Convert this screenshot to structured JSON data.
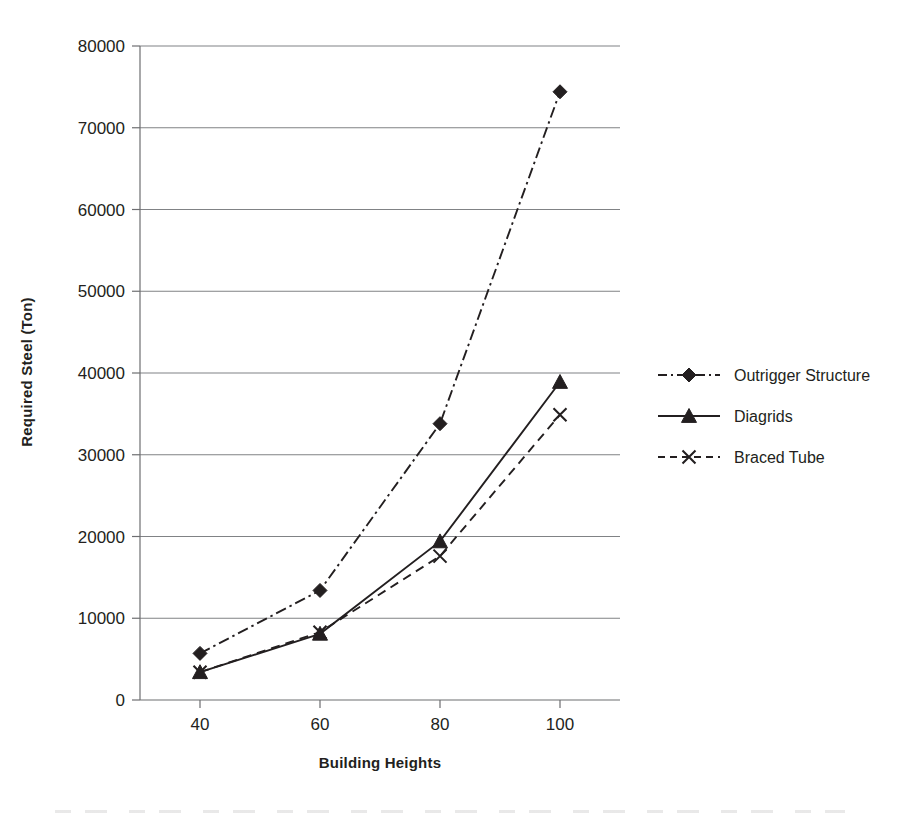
{
  "chart_data": {
    "type": "line",
    "title": "",
    "xlabel": "Building Heights",
    "ylabel": "Required Steel (Ton)",
    "x": [
      40,
      60,
      80,
      100
    ],
    "categories": [
      "40",
      "60",
      "80",
      "100"
    ],
    "xlim": [
      30,
      110
    ],
    "ylim": [
      0,
      80000
    ],
    "y_ticks": [
      0,
      10000,
      20000,
      30000,
      40000,
      50000,
      60000,
      70000,
      80000
    ],
    "y_tick_labels": [
      "0",
      "10000",
      "20000",
      "30000",
      "40000",
      "50000",
      "60000",
      "70000",
      "80000"
    ],
    "x_ticks": [
      40,
      60,
      80,
      100
    ],
    "x_tick_labels": [
      "40",
      "60",
      "80",
      "100"
    ],
    "grid": "horizontal",
    "legend_position": "right",
    "series": [
      {
        "name": "Outrigger Structure",
        "values": [
          5700,
          13400,
          33800,
          74400
        ],
        "line_style": "dashdot",
        "marker": "diamond",
        "color": "#231f20"
      },
      {
        "name": "Diagrids",
        "values": [
          3400,
          8100,
          19400,
          38900
        ],
        "line_style": "solid",
        "marker": "triangle",
        "color": "#231f20"
      },
      {
        "name": "Braced Tube",
        "values": [
          3400,
          8300,
          17600,
          34900
        ],
        "line_style": "dashed",
        "marker": "x",
        "color": "#231f20"
      }
    ]
  },
  "legend": {
    "items": [
      {
        "label": "Outrigger Structure",
        "style": "dashdot",
        "marker": "diamond"
      },
      {
        "label": "Diagrids",
        "style": "solid",
        "marker": "triangle"
      },
      {
        "label": "Braced Tube",
        "style": "dashed",
        "marker": "x"
      }
    ]
  },
  "axes": {
    "y_title": "Required Steel (Ton)",
    "x_title": "Building Heights"
  },
  "colors": {
    "ink": "#231f20",
    "grid": "#808285",
    "axis": "#6d6e71",
    "background": "#ffffff"
  }
}
